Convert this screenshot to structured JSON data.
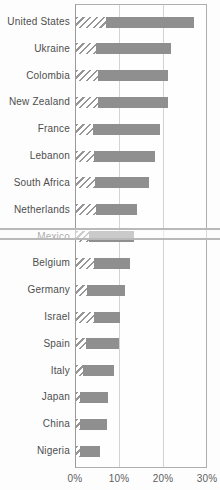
{
  "window": {
    "width_px": 220,
    "height_px": 490,
    "background": "#fdfdfd"
  },
  "chart_data": {
    "type": "bar",
    "orientation": "horizontal",
    "stacked": true,
    "title": "",
    "xlabel": "",
    "ylabel": "",
    "categories": [
      "United States",
      "Ukraine",
      "Colombia",
      "New Zealand",
      "France",
      "Lebanon",
      "South Africa",
      "Netherlands",
      "Mexico",
      "Belgium",
      "Germany",
      "Israel",
      "Spain",
      "Italy",
      "Japan",
      "China",
      "Nigeria"
    ],
    "series": [
      {
        "name": "hatched-segment",
        "pattern": "diagonal-hatch",
        "values": [
          6.7,
          4.5,
          5.0,
          5.0,
          3.8,
          4.0,
          4.2,
          4.5,
          3.0,
          4.0,
          2.5,
          4.0,
          2.3,
          1.5,
          0.8,
          0.8,
          0.8
        ]
      },
      {
        "name": "solid-segment",
        "pattern": "solid",
        "values": [
          20.1,
          17.2,
          16.0,
          15.8,
          15.2,
          14.0,
          12.3,
          9.4,
          10.1,
          8.3,
          8.7,
          6.1,
          7.5,
          7.2,
          6.4,
          6.2,
          4.7
        ]
      }
    ],
    "totals_percent": [
      26.8,
      21.7,
      21.0,
      20.8,
      19.0,
      18.0,
      16.5,
      13.9,
      13.1,
      12.3,
      11.2,
      10.1,
      9.8,
      8.7,
      7.2,
      7.0,
      5.5
    ],
    "x_ticks": [
      "0%",
      "10%",
      "20%",
      "30%"
    ],
    "x_range_percent": [
      0,
      30
    ],
    "grid": true,
    "legend": "none",
    "highlight_band_category": "Mexico"
  },
  "colors": {
    "bar_solid": "#8f8f8f",
    "bar_hatch_stripe": "#969696",
    "gridline": "#d3d3d3",
    "plot_border": "#aeaeae",
    "axis_line": "#9a9a9a",
    "category_label_text": "#4e4e4e",
    "tick_label_text": "#5e5e5e",
    "highlight_band_line": "#b9b9b9"
  }
}
